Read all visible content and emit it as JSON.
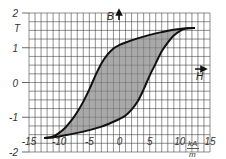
{
  "chart_data": {
    "type": "line",
    "title": "",
    "subtitle": "",
    "xlabel": "H",
    "xunit": "kA/m",
    "ylabel": "B",
    "yunit": "T",
    "xlim": [
      -15,
      15
    ],
    "ylim": [
      -2,
      2
    ],
    "x_ticks": [
      -15,
      -10,
      -5,
      0,
      5,
      10,
      15
    ],
    "x_tick_labels": [
      "-15",
      "-10",
      "-5",
      "0",
      "5",
      "10",
      "15"
    ],
    "y_ticks": [
      -2,
      -1,
      0,
      1,
      2
    ],
    "y_tick_labels": [
      "-2",
      "-1",
      "0",
      "1",
      "2"
    ],
    "grid": true,
    "grid_minor_x": 1,
    "grid_minor_y": 0.25,
    "legend": null,
    "fill_between_branches": true,
    "fill_color": "#9a9a9a",
    "line_color": "#111111",
    "series": [
      {
        "name": "descending branch (upper)",
        "x": [
          12.5,
          11,
          9,
          7,
          5,
          3,
          1,
          0,
          -1,
          -2,
          -3,
          -4,
          -5,
          -6,
          -7,
          -8,
          -9,
          -10,
          -11,
          -12.5
        ],
        "y": [
          1.57,
          1.56,
          1.52,
          1.45,
          1.37,
          1.27,
          1.15,
          1.08,
          0.98,
          0.8,
          0.55,
          0.2,
          -0.2,
          -0.55,
          -0.85,
          -1.1,
          -1.3,
          -1.45,
          -1.55,
          -1.6
        ]
      },
      {
        "name": "ascending branch (lower)",
        "x": [
          -12.5,
          -11,
          -9,
          -7,
          -5,
          -3,
          -1,
          0,
          1,
          2,
          3,
          4,
          5,
          6,
          7,
          8,
          9,
          10,
          11,
          12.5
        ],
        "y": [
          -1.6,
          -1.58,
          -1.52,
          -1.45,
          -1.37,
          -1.27,
          -1.13,
          -1.05,
          -0.95,
          -0.78,
          -0.55,
          -0.2,
          0.2,
          0.55,
          0.9,
          1.15,
          1.35,
          1.48,
          1.55,
          1.57
        ]
      }
    ],
    "annotations": [
      {
        "text": "B",
        "position": "near top of vertical axis, with up arrow"
      },
      {
        "text": "H",
        "position": "right side near B=0, with right arrow"
      },
      {
        "text": "T",
        "position": "y unit between 2 and 1"
      },
      {
        "text": "kA/m",
        "position": "x unit between 10 and 15"
      }
    ]
  },
  "labels": {
    "y_unit": "T",
    "x_unit_num": "kA",
    "x_unit_den": "m",
    "b_axis": "B",
    "h_axis": "H"
  }
}
